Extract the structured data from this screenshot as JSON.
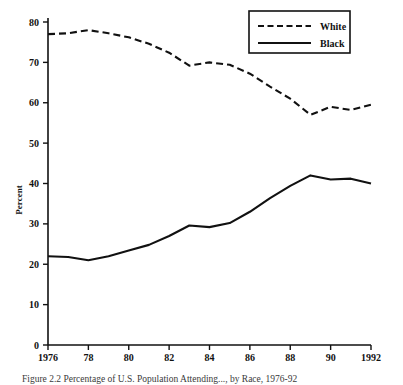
{
  "figure": {
    "caption": "Figure 2.2  Percentage of U.S. Population Attending..., by Race, 1976-92",
    "top_fragment": ""
  },
  "chart_data": {
    "type": "line",
    "title": "",
    "subtitle": "",
    "xlabel": "",
    "ylabel": "Percent",
    "x": [
      1976,
      1977,
      1978,
      1979,
      1980,
      1981,
      1982,
      1983,
      1984,
      1985,
      1986,
      1987,
      1988,
      1989,
      1990,
      1991,
      1992
    ],
    "xlim": [
      1976,
      1992
    ],
    "ylim": [
      0,
      80
    ],
    "xticks": [
      1976,
      1978,
      1980,
      1982,
      1984,
      1986,
      1988,
      1990,
      1992
    ],
    "xtick_labels": [
      "1976",
      "78",
      "80",
      "82",
      "84",
      "86",
      "88",
      "90",
      "1992"
    ],
    "yticks": [
      0,
      10,
      20,
      30,
      40,
      50,
      60,
      70,
      80
    ],
    "ytick_labels": [
      "0",
      "10",
      "20",
      "30",
      "40",
      "50",
      "60",
      "70",
      "80"
    ],
    "grid": false,
    "legend_position": "top-right",
    "series": [
      {
        "name": "White",
        "style": "dashed",
        "color": "#111111",
        "values": [
          77.0,
          77.2,
          78.0,
          77.2,
          76.2,
          74.6,
          72.4,
          69.2,
          70.0,
          69.4,
          67.2,
          64.0,
          61.0,
          57.0,
          59.0,
          58.2,
          59.5
        ]
      },
      {
        "name": "Black",
        "style": "solid",
        "color": "#111111",
        "values": [
          22.0,
          21.8,
          21.0,
          22.0,
          23.4,
          24.8,
          27.0,
          29.6,
          29.2,
          30.2,
          33.0,
          36.4,
          39.4,
          42.0,
          41.0,
          41.2,
          40.0
        ]
      }
    ],
    "legend": [
      {
        "label": "White",
        "style": "dashed"
      },
      {
        "label": "Black",
        "style": "solid"
      }
    ]
  }
}
